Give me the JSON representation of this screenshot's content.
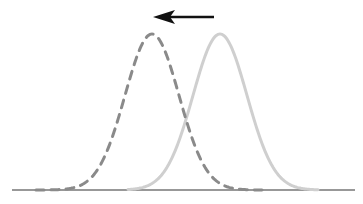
{
  "diagram": {
    "baseline": {
      "x1": 12,
      "x2": 355,
      "y": 190,
      "color": "#333333",
      "width": 1.2
    },
    "arrow": {
      "x_from": 214,
      "x_to": 153,
      "y": 17,
      "color": "#111111",
      "direction": "left"
    },
    "curves": [
      {
        "name": "shifted-distribution",
        "style": "dashed",
        "mean_x": 152,
        "sigma": 27,
        "peak_y": 34,
        "color": "#8a8a8a",
        "width": 3,
        "dash": "8,7"
      },
      {
        "name": "original-distribution",
        "style": "solid",
        "mean_x": 220,
        "sigma": 27,
        "peak_y": 34,
        "color": "#cfcfcf",
        "width": 3
      }
    ]
  }
}
